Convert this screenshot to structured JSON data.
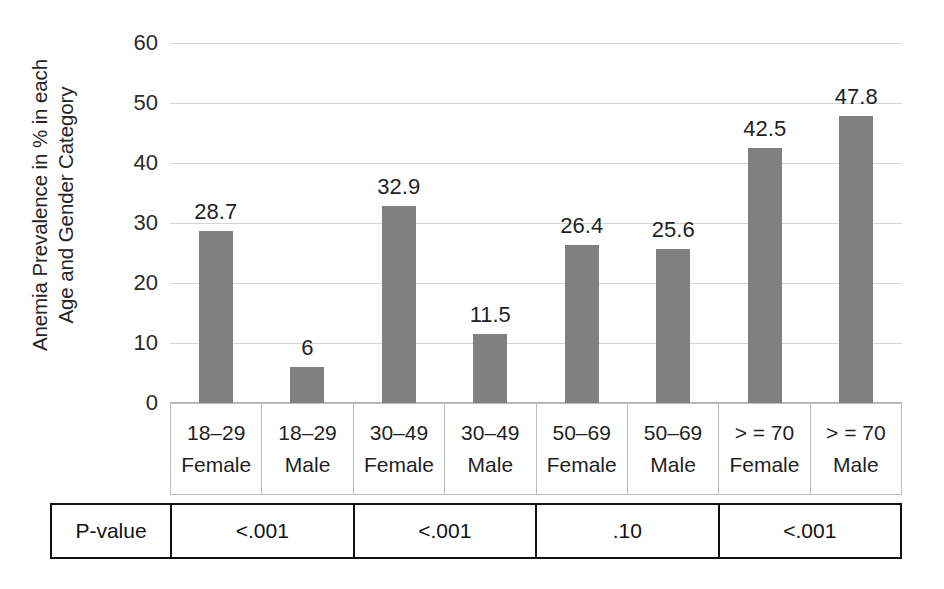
{
  "chart_data": {
    "type": "bar",
    "title": "",
    "xlabel": "",
    "ylabel": "Anemia Prevalence in % in each Age and Gender Category",
    "ylabel_line1": "Anemia Prevalence in % in each",
    "ylabel_line2": "Age and Gender Category",
    "ylim": [
      0,
      60
    ],
    "ytick_labels": [
      "0",
      "10",
      "20",
      "30",
      "40",
      "50",
      "60"
    ],
    "ytick_values": [
      0,
      10,
      20,
      30,
      40,
      50,
      60
    ],
    "grid": true,
    "legend": "none",
    "bar_color": "#808080",
    "categories": [
      "18–29 Female",
      "18–29 Male",
      "30–49 Female",
      "30–49 Male",
      "50–69 Female",
      "50–69 Male",
      "> = 70 Female",
      "> = 70 Male"
    ],
    "age_groups": [
      "18–29",
      "18–29",
      "30–49",
      "30–49",
      "50–69",
      "50–69",
      "> = 70",
      "> = 70"
    ],
    "genders": [
      "Female",
      "Male",
      "Female",
      "Male",
      "Female",
      "Male",
      "Female",
      "Male"
    ],
    "values": [
      28.7,
      6,
      32.9,
      11.5,
      26.4,
      25.6,
      42.5,
      47.8
    ],
    "data_labels": [
      "28.7",
      "6",
      "32.9",
      "11.5",
      "26.4",
      "25.6",
      "42.5",
      "47.8"
    ]
  },
  "pvalue_table": {
    "row_label": "P-value",
    "groups": [
      "18–29",
      "30–49",
      "50–69",
      "> = 70"
    ],
    "values": [
      "<.001",
      "<.001",
      ".10",
      "<.001"
    ]
  }
}
